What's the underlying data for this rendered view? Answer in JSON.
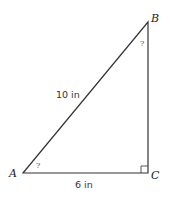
{
  "diagram": {
    "type": "right-triangle",
    "vertices": {
      "A": {
        "label": "A",
        "x": 23,
        "y": 173
      },
      "B": {
        "label": "B",
        "x": 148,
        "y": 22
      },
      "C": {
        "label": "C",
        "x": 148,
        "y": 173
      }
    },
    "sides": {
      "AB": {
        "label": "10 in"
      },
      "AC": {
        "label": "6 in"
      }
    },
    "angles": {
      "A": {
        "label": "?"
      },
      "B": {
        "label": "?"
      },
      "C": {
        "right_angle": true
      }
    },
    "stroke_color": "#333333"
  }
}
